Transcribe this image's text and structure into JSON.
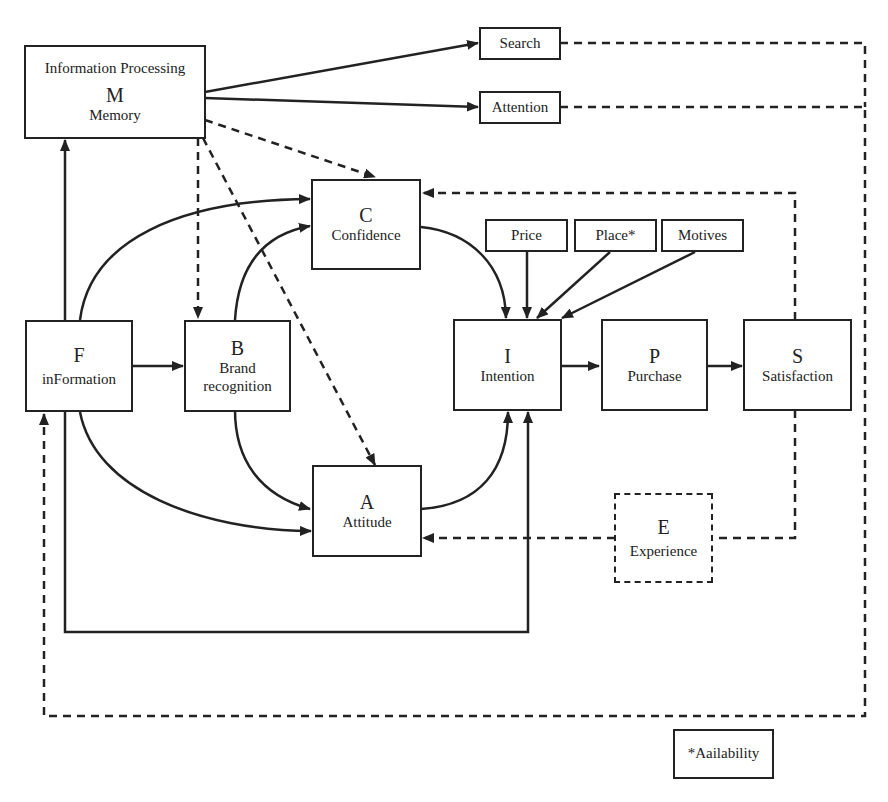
{
  "diagram": {
    "type": "consumer-behavior-flow-model",
    "nodes": {
      "memory": {
        "id": "M",
        "title": "Information Processing",
        "letter": "M",
        "label": "Memory"
      },
      "search": {
        "label": "Search"
      },
      "attention": {
        "label": "Attention"
      },
      "confidence": {
        "id": "C",
        "letter": "C",
        "label": "Confidence"
      },
      "information": {
        "id": "F",
        "letter": "F",
        "label": "inFormation"
      },
      "brand": {
        "id": "B",
        "letter": "B",
        "label_line1": "Brand",
        "label_line2": "recognition"
      },
      "price": {
        "label": "Price"
      },
      "place": {
        "label": "Place*"
      },
      "motives": {
        "label": "Motives"
      },
      "intention": {
        "id": "I",
        "letter": "I",
        "label": "Intention"
      },
      "purchase": {
        "id": "P",
        "letter": "P",
        "label": "Purchase"
      },
      "satisfaction": {
        "id": "S",
        "letter": "S",
        "label": "Satisfaction"
      },
      "attitude": {
        "id": "A",
        "letter": "A",
        "label": "Attitude"
      },
      "experience": {
        "id": "E",
        "letter": "E",
        "label": "Experience",
        "style": "dashed"
      },
      "availability_note": {
        "label": "*Aailability"
      }
    },
    "edges": [
      {
        "from": "M",
        "to": "Search",
        "style": "solid"
      },
      {
        "from": "M",
        "to": "Attention",
        "style": "solid"
      },
      {
        "from": "M",
        "to": "C",
        "style": "dashed"
      },
      {
        "from": "M",
        "to": "B",
        "style": "dashed"
      },
      {
        "from": "M",
        "to": "A",
        "style": "dashed"
      },
      {
        "from": "F",
        "to": "M",
        "style": "solid"
      },
      {
        "from": "F",
        "to": "C",
        "style": "solid"
      },
      {
        "from": "F",
        "to": "B",
        "style": "solid"
      },
      {
        "from": "F",
        "to": "A",
        "style": "solid"
      },
      {
        "from": "F",
        "to": "I",
        "style": "solid"
      },
      {
        "from": "B",
        "to": "C",
        "style": "solid"
      },
      {
        "from": "B",
        "to": "A",
        "style": "solid"
      },
      {
        "from": "C",
        "to": "I",
        "style": "solid"
      },
      {
        "from": "A",
        "to": "I",
        "style": "solid"
      },
      {
        "from": "Price",
        "to": "I",
        "style": "solid"
      },
      {
        "from": "Place*",
        "to": "I",
        "style": "solid"
      },
      {
        "from": "Motives",
        "to": "I",
        "style": "solid"
      },
      {
        "from": "I",
        "to": "P",
        "style": "solid"
      },
      {
        "from": "P",
        "to": "S",
        "style": "solid"
      },
      {
        "from": "S",
        "to": "C",
        "style": "dashed"
      },
      {
        "from": "S",
        "to": "E",
        "style": "dashed"
      },
      {
        "from": "E",
        "to": "A",
        "style": "dashed"
      },
      {
        "from": "Search",
        "to": "F",
        "style": "dashed"
      },
      {
        "from": "Attention",
        "to": "F",
        "style": "dashed"
      }
    ]
  }
}
